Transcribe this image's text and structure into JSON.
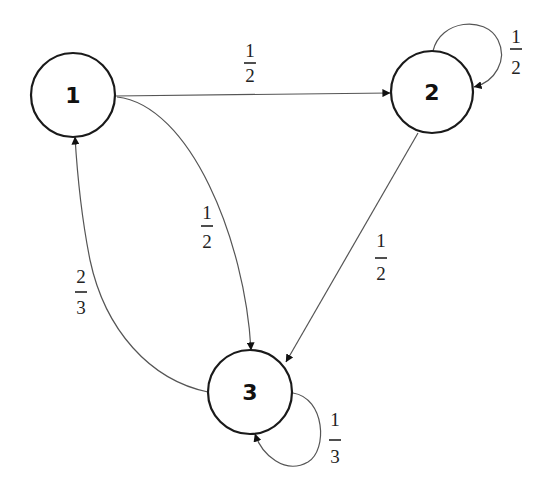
{
  "diagram": {
    "type": "markov-chain-state-transition",
    "nodes": [
      {
        "id": "1",
        "label": "1",
        "cx": 73,
        "cy": 95,
        "r": 42
      },
      {
        "id": "2",
        "label": "2",
        "cx": 432,
        "cy": 92,
        "r": 41
      },
      {
        "id": "3",
        "label": "3",
        "cx": 250,
        "cy": 392,
        "r": 42
      }
    ],
    "edges": [
      {
        "from": "1",
        "to": "2",
        "weight": {
          "num": "1",
          "den": "2"
        }
      },
      {
        "from": "2",
        "to": "2",
        "weight": {
          "num": "1",
          "den": "2"
        }
      },
      {
        "from": "1",
        "to": "3",
        "weight": {
          "num": "1",
          "den": "2"
        }
      },
      {
        "from": "2",
        "to": "3",
        "weight": {
          "num": "1",
          "den": "2"
        }
      },
      {
        "from": "3",
        "to": "1",
        "weight": {
          "num": "2",
          "den": "3"
        }
      },
      {
        "from": "3",
        "to": "3",
        "weight": {
          "num": "1",
          "den": "3"
        }
      }
    ],
    "colors": {
      "node_stroke": "#1a1a1a",
      "edge_stroke": "#555555",
      "background": "#ffffff"
    }
  }
}
